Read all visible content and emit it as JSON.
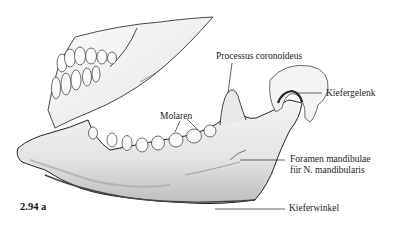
{
  "figure": {
    "number": "2.94 a"
  },
  "labels": {
    "processus": "Processus coronoideus",
    "kiefergelenk": "Kiefergelenk",
    "molaren": "Molaren",
    "foramen_line1": "Foramen mandibulae",
    "foramen_line2": "für N. mandibularis",
    "kieferwinkel": "Kieferwinkel"
  },
  "colors": {
    "ink": "#1a1a1a",
    "bone": "#f2f2f2",
    "shade": "#c8c8c8",
    "background": "#ffffff"
  }
}
